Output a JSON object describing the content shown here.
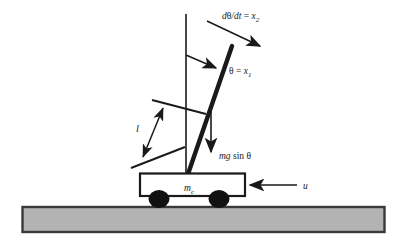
{
  "figure": {
    "type": "physics-schematic",
    "background_color": "#ffffff",
    "line_color": "#1a1a1a",
    "ground_fill": "#b3b3b3",
    "ground_stroke": "#3a3a3a"
  },
  "labels": {
    "angular_velocity": {
      "d": "d",
      "theta": "θ",
      "slash_dt": "/dt",
      "equals": " = ",
      "x": "x",
      "subscript": "2",
      "full_text": "dθ/dt = x₂"
    },
    "angle": {
      "theta": "θ",
      "equals": " = ",
      "x": "x",
      "subscript": "1",
      "full_text": "θ = x₁"
    },
    "gravity_component": {
      "mg": "mg",
      "sin": " sin ",
      "theta": "θ",
      "full_text": "mg sin θ"
    },
    "length": {
      "symbol": "l",
      "full_text": "l"
    },
    "cart_mass": {
      "m": "m",
      "subscript": "c",
      "full_text": "mᴄ"
    },
    "control_input": {
      "symbol": "u",
      "full_text": "u"
    }
  },
  "elements": {
    "vertical_reference_line": "vertical-reference-line",
    "pendulum_rod": "pendulum-rod",
    "cart_body": "cart-body",
    "wheel_left": "wheel-left",
    "wheel_right": "wheel-right",
    "ground": "ground-surface",
    "angular_velocity_arrow": "angular-velocity-arrow",
    "angle_arrow": "angle-indicator-arrow",
    "gravity_arrow": "gravity-force-arrow",
    "force_arrow": "control-force-arrow",
    "length_dimension_arrow": "length-dimension-arrow",
    "length_tick_upper": "length-tick-upper",
    "length_tick_lower": "length-tick-lower"
  }
}
